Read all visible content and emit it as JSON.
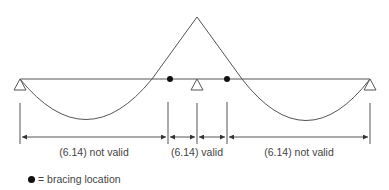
{
  "diagram": {
    "type": "continuous-beam-moment-diagram",
    "colors": {
      "line": "#555555",
      "dot": "#111111",
      "text": "#444444"
    },
    "supports": [
      {
        "name": "left-support",
        "x": 20
      },
      {
        "name": "middle-support",
        "x": 197
      },
      {
        "name": "right-support",
        "x": 370
      }
    ],
    "bracing_points": [
      {
        "name": "left-bracing",
        "x": 170
      },
      {
        "name": "right-bracing",
        "x": 227
      }
    ],
    "segments": [
      {
        "label": "(6.14) not valid",
        "from": 20,
        "to": 168
      },
      {
        "label": "(6.14) valid",
        "from": 168,
        "to": 227
      },
      {
        "label": "(6.14) not valid",
        "from": 227,
        "to": 370
      }
    ]
  },
  "labels": {
    "left_segment": "(6.14) not valid",
    "middle_segment": "(6.14) valid",
    "right_segment": "(6.14) not valid"
  },
  "legend": {
    "symbol": "dot-icon",
    "text": "= bracing location"
  }
}
